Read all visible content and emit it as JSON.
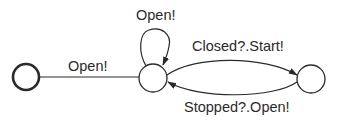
{
  "diagram": {
    "type": "state-machine",
    "colors": {
      "stroke": "#2a2a2a",
      "background": "#ffffff",
      "text": "#2a2a2a"
    },
    "states": [
      {
        "id": "initial",
        "kind": "start-state"
      },
      {
        "id": "s1",
        "kind": "state"
      },
      {
        "id": "s2",
        "kind": "state"
      }
    ],
    "transitions": [
      {
        "from": "initial",
        "to": "s1",
        "label": "Open!"
      },
      {
        "from": "s1",
        "to": "s1",
        "label": "Open!"
      },
      {
        "from": "s1",
        "to": "s2",
        "label": "Closed?.Start!"
      },
      {
        "from": "s2",
        "to": "s1",
        "label": "Stopped?.Open!"
      }
    ]
  }
}
